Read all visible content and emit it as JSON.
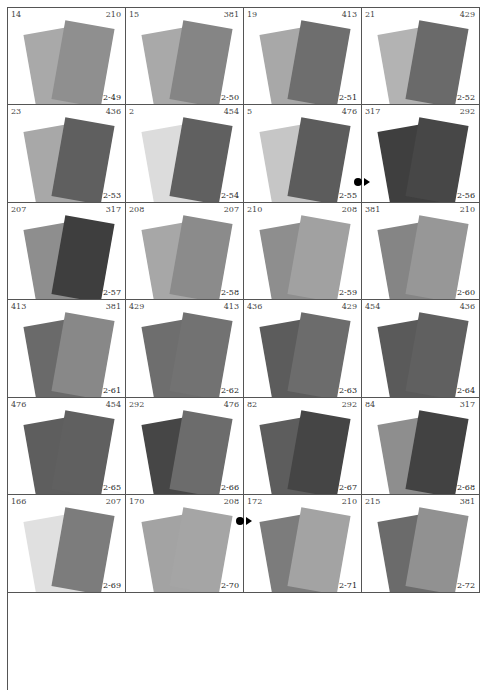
{
  "swatches": [
    {
      "left": "14",
      "right": "210",
      "code": "2-49",
      "back": "#a9a9a9",
      "front": "#8f8f8f"
    },
    {
      "left": "15",
      "right": "381",
      "code": "2-50",
      "back": "#a9a9a9",
      "front": "#858585"
    },
    {
      "left": "19",
      "right": "413",
      "code": "2-51",
      "back": "#a8a8a8",
      "front": "#6e6e6e"
    },
    {
      "left": "21",
      "right": "429",
      "code": "2-52",
      "back": "#b3b3b3",
      "front": "#6a6a6a"
    },
    {
      "left": "23",
      "right": "436",
      "code": "2-53",
      "back": "#a8a8a8",
      "front": "#5f5f5f"
    },
    {
      "left": "2",
      "right": "454",
      "code": "2-54",
      "back": "#dcdcdc",
      "front": "#606060"
    },
    {
      "left": "5",
      "right": "476",
      "code": "2-55",
      "back": "#c6c6c6",
      "front": "#5c5c5c"
    },
    {
      "left": "317",
      "right": "292",
      "code": "2-56",
      "back": "#3f3f3f",
      "front": "#474747"
    },
    {
      "left": "207",
      "right": "317",
      "code": "2-57",
      "back": "#8e8e8e",
      "front": "#3e3e3e"
    },
    {
      "left": "208",
      "right": "207",
      "code": "2-58",
      "back": "#a7a7a7",
      "front": "#8b8b8b"
    },
    {
      "left": "210",
      "right": "208",
      "code": "2-59",
      "back": "#8e8e8e",
      "front": "#a1a1a1"
    },
    {
      "left": "381",
      "right": "210",
      "code": "2-60",
      "back": "#858585",
      "front": "#979797"
    },
    {
      "left": "413",
      "right": "381",
      "code": "2-61",
      "back": "#6a6a6a",
      "front": "#888888"
    },
    {
      "left": "429",
      "right": "413",
      "code": "2-62",
      "back": "#6e6e6e",
      "front": "#727272"
    },
    {
      "left": "436",
      "right": "429",
      "code": "2-63",
      "back": "#5c5c5c",
      "front": "#6c6c6c"
    },
    {
      "left": "454",
      "right": "436",
      "code": "2-64",
      "back": "#5a5a5a",
      "front": "#606060"
    },
    {
      "left": "476",
      "right": "454",
      "code": "2-65",
      "back": "#5e5e5e",
      "front": "#606060"
    },
    {
      "left": "292",
      "right": "476",
      "code": "2-66",
      "back": "#464646",
      "front": "#6c6c6c"
    },
    {
      "left": "82",
      "right": "292",
      "code": "2-67",
      "back": "#5d5d5d",
      "front": "#454545"
    },
    {
      "left": "84",
      "right": "317",
      "code": "2-68",
      "back": "#8e8e8e",
      "front": "#424242"
    },
    {
      "left": "166",
      "right": "207",
      "code": "2-69",
      "back": "#e0e0e0",
      "front": "#7c7c7c"
    },
    {
      "left": "170",
      "right": "208",
      "code": "2-70",
      "back": "#a3a3a3",
      "front": "#a5a5a5"
    },
    {
      "left": "172",
      "right": "210",
      "code": "2-71",
      "back": "#7c7c7c",
      "front": "#a3a3a3"
    },
    {
      "left": "215",
      "right": "381",
      "code": "2-72",
      "back": "#6b6b6b",
      "front": "#919191"
    }
  ],
  "markers": [
    {
      "between": "2-55|2-56"
    },
    {
      "between": "2-66|2-67"
    }
  ]
}
